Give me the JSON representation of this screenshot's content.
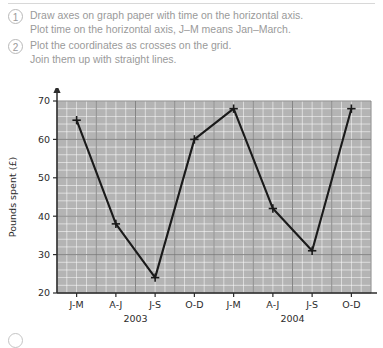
{
  "instructions": {
    "steps": [
      {
        "number": "1",
        "lines": [
          "Draw axes on graph paper with time on the horizontal axis.",
          "Plot time on the horizontal axis, J–M means Jan–March."
        ]
      },
      {
        "number": "2",
        "lines": [
          "Plot the coordinates as crosses on the grid.",
          "Join them up with straight lines."
        ]
      }
    ]
  },
  "chart_data": {
    "type": "line",
    "title": "",
    "xlabel": "",
    "ylabel": "Pounds spent (£)",
    "categories": [
      "J-M",
      "A-J",
      "J-S",
      "O-D",
      "J-M",
      "A-J",
      "J-S",
      "O-D"
    ],
    "group_labels": [
      "2003",
      "2004"
    ],
    "values": [
      65,
      38,
      24,
      60,
      68,
      42,
      31,
      68
    ],
    "ylim": [
      20,
      70
    ],
    "ytick_labels": [
      "20",
      "30",
      "40",
      "50",
      "60",
      "70"
    ],
    "yticks": [
      20,
      30,
      40,
      50,
      60,
      70
    ],
    "grid": true,
    "minor_grid_step": 2,
    "marker": "cross",
    "legend": "none",
    "colors": {
      "line": "#1a1a1a",
      "plot_background": "#b4b4b4",
      "minor_grid": "#ffffff",
      "major_grid": "#7a7a7a",
      "axis": "#2c2c2c",
      "instruction_text": "#9a9a9a"
    }
  }
}
